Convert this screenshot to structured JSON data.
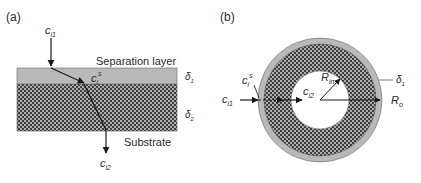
{
  "panel_a": {
    "label": "(a)",
    "layer_label": "Separation layer",
    "substrate_label": "Substrate",
    "c_in": {
      "main": "c",
      "sub": "i1"
    },
    "c_surface": {
      "main": "c",
      "sub": "i",
      "sup": "s"
    },
    "c_out": {
      "main": "c",
      "sub": "i2"
    },
    "delta1": {
      "main": "δ",
      "sub": "1"
    },
    "delta2": {
      "main": "δ",
      "sub": "2"
    }
  },
  "panel_b": {
    "label": "(b)",
    "c_in": {
      "main": "c",
      "sub": "i1"
    },
    "c_surface": {
      "main": "c",
      "sub": "i",
      "sup": "s"
    },
    "c_out": {
      "main": "c",
      "sub": "i2"
    },
    "r_in": {
      "main": "R",
      "sub": "in"
    },
    "r_out": {
      "main": "R",
      "sub": "o"
    },
    "delta1": {
      "main": "δ",
      "sub": "1"
    }
  },
  "colors": {
    "layer_gray": "#b9b9b9",
    "substrate_dark": "#4a4a4a",
    "substrate_light": "#d8d8d8",
    "line": "#1a1a1a"
  }
}
